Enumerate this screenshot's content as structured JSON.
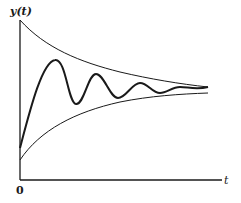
{
  "diagram": {
    "axes": {
      "y_label": "y(t)",
      "x_label": "t",
      "origin_label": "0"
    },
    "curves": [
      {
        "name": "upper-envelope",
        "description": "decaying exponential envelope from above"
      },
      {
        "name": "lower-envelope",
        "description": "rising exponential envelope from below"
      },
      {
        "name": "response",
        "description": "damped oscillation y(t) converging to steady state"
      }
    ],
    "colors": {
      "line": "#1a1a1a",
      "background": "#ffffff"
    }
  }
}
